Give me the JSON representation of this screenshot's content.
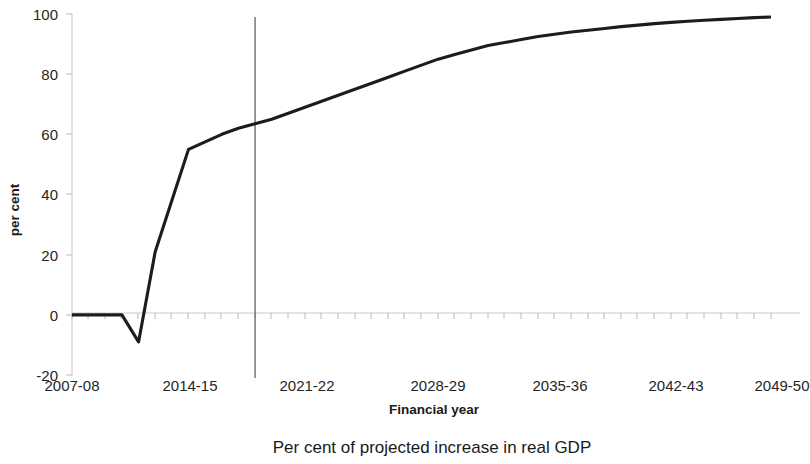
{
  "chart_data": {
    "type": "line",
    "title": "",
    "caption": "Per cent of projected increase in real GDP",
    "xlabel": "Financial year",
    "ylabel": "per cent",
    "ylim": [
      -20,
      100
    ],
    "ytick_labels": [
      "100",
      "80",
      "60",
      "40",
      "20",
      "0",
      "-20"
    ],
    "ytick_values": [
      100,
      80,
      60,
      40,
      20,
      0,
      -20
    ],
    "xtick_labels": [
      "2007-08",
      "2014-15",
      "2021-22",
      "2028-29",
      "2035-36",
      "2042-43",
      "2049-50"
    ],
    "xtick_values": [
      "2007-08",
      "2014-15",
      "2021-22",
      "2028-29",
      "2035-36",
      "2042-43",
      "2049-50"
    ],
    "grid": false,
    "legend": "none",
    "line_color": "#1c1c1c",
    "annotations": [
      {
        "name": "projection-divider",
        "type": "vertical-line",
        "x": "2018-19",
        "color": "#6e6e6e"
      }
    ],
    "series": [
      {
        "name": "Per cent of projected increase in real GDP",
        "x": [
          "2007-08",
          "2008-09",
          "2009-10",
          "2010-11",
          "2011-12",
          "2012-13",
          "2013-14",
          "2014-15",
          "2015-16",
          "2016-17",
          "2017-18",
          "2018-19",
          "2019-20",
          "2020-21",
          "2021-22",
          "2022-23",
          "2023-24",
          "2024-25",
          "2025-26",
          "2026-27",
          "2027-28",
          "2028-29",
          "2029-30",
          "2030-31",
          "2031-32",
          "2032-33",
          "2033-34",
          "2034-35",
          "2035-36",
          "2036-37",
          "2037-38",
          "2038-39",
          "2039-40",
          "2040-41",
          "2041-42",
          "2042-43",
          "2043-44",
          "2044-45",
          "2045-46",
          "2046-47",
          "2047-48",
          "2048-49",
          "2049-50"
        ],
        "values": [
          0,
          0,
          0,
          0,
          -9,
          21,
          38,
          55,
          57.5,
          60,
          62,
          63.5,
          65,
          67,
          69,
          71,
          73,
          75,
          77,
          79,
          81,
          83,
          85,
          86.5,
          88,
          89.5,
          90.5,
          91.5,
          92.5,
          93.3,
          94,
          94.6,
          95.2,
          95.8,
          96.3,
          96.8,
          97.2,
          97.6,
          97.9,
          98.2,
          98.5,
          98.8,
          99
        ]
      }
    ]
  }
}
